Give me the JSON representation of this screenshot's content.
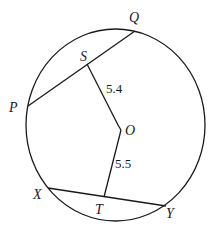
{
  "diagram": {
    "type": "circle-chords",
    "circle": {
      "center_label": "O"
    },
    "points": {
      "Q": "Q",
      "S": "S",
      "P": "P",
      "O": "O",
      "X": "X",
      "T": "T",
      "Y": "Y"
    },
    "segments": [
      {
        "name": "chord-PQ",
        "from": "P",
        "to": "Q"
      },
      {
        "name": "chord-XY",
        "from": "X",
        "to": "Y"
      },
      {
        "name": "segment-OS",
        "from": "O",
        "to": "S",
        "length_label": "5.4"
      },
      {
        "name": "segment-OT",
        "from": "O",
        "to": "T",
        "length_label": "5.5"
      }
    ],
    "measurements": {
      "OS": "5.4",
      "OT": "5.5"
    }
  }
}
